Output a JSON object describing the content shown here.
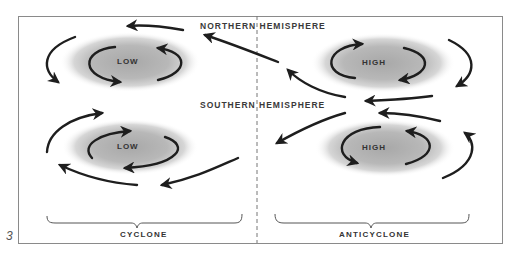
{
  "figure": {
    "number": "3",
    "hemispheres": {
      "north": "NORTHERN HEMISPHERE",
      "south": "SOUTHERN HEMISPHERE"
    },
    "panels": [
      {
        "id": "north-low",
        "label": "LOW",
        "hemisphere": "north",
        "rotation": "counterclockwise"
      },
      {
        "id": "north-high",
        "label": "HIGH",
        "hemisphere": "north",
        "rotation": "clockwise"
      },
      {
        "id": "south-low",
        "label": "LOW",
        "hemisphere": "south",
        "rotation": "clockwise"
      },
      {
        "id": "south-high",
        "label": "HIGH",
        "hemisphere": "south",
        "rotation": "counterclockwise"
      }
    ],
    "categories": {
      "left": "CYCLONE",
      "right": "ANTICYCLONE"
    },
    "colors": {
      "frame": "#8a8a8a",
      "arrow": "#1e1e1e",
      "pressure_fill": "#b4b4b4",
      "text": "#3a3a3a"
    }
  }
}
